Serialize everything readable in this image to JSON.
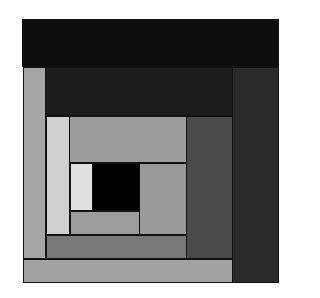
{
  "diagram": {
    "pieces": [
      {
        "id": "top-band",
        "x": 0,
        "y": 0,
        "w": 257,
        "h": 48,
        "color": "#0e0e0e"
      },
      {
        "id": "right-strip",
        "x": 210,
        "y": 48,
        "w": 47,
        "h": 216,
        "color": "#2a2a2a"
      },
      {
        "id": "left-strip",
        "x": 1,
        "y": 48,
        "w": 23,
        "h": 192,
        "color": "#a6a6a6"
      },
      {
        "id": "bottom-strip",
        "x": 1,
        "y": 240,
        "w": 210,
        "h": 24,
        "color": "#a3a3a3"
      },
      {
        "id": "second-top-band",
        "x": 23,
        "y": 48,
        "w": 188,
        "h": 49,
        "color": "#1c1c1c"
      },
      {
        "id": "inner-right-strip",
        "x": 164,
        "y": 97,
        "w": 47,
        "h": 143,
        "color": "#4a4a4a"
      },
      {
        "id": "inner-left-strip",
        "x": 24,
        "y": 97,
        "w": 24,
        "h": 119,
        "color": "#cfcfcf"
      },
      {
        "id": "inner-bottom-strip",
        "x": 24,
        "y": 216,
        "w": 141,
        "h": 24,
        "color": "#787878"
      },
      {
        "id": "inner-top-block",
        "x": 47,
        "y": 97,
        "w": 118,
        "h": 47,
        "color": "#9b9b9b"
      },
      {
        "id": "center-right-block",
        "x": 117,
        "y": 144,
        "w": 48,
        "h": 72,
        "color": "#999999"
      },
      {
        "id": "center-left-strip",
        "x": 48,
        "y": 144,
        "w": 23,
        "h": 48,
        "color": "#e0e0e0"
      },
      {
        "id": "center-bottom-strip",
        "x": 48,
        "y": 192,
        "w": 70,
        "h": 24,
        "color": "#9d9d9d"
      },
      {
        "id": "center-square",
        "x": 70,
        "y": 144,
        "w": 48,
        "h": 48,
        "color": "#000000"
      }
    ]
  }
}
